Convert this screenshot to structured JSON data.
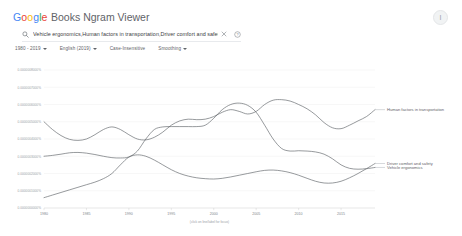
{
  "header": {
    "logo_letters": [
      {
        "ch": "G",
        "color": "#4285F4"
      },
      {
        "ch": "o",
        "color": "#EA4335"
      },
      {
        "ch": "o",
        "color": "#FBBC05"
      },
      {
        "ch": "g",
        "color": "#4285F4"
      },
      {
        "ch": "l",
        "color": "#34A853"
      },
      {
        "ch": "e",
        "color": "#EA4335"
      }
    ],
    "logo_text": "Google",
    "product_name": "Books Ngram Viewer",
    "avatar_glyph": "I",
    "avatar_name": "account-avatar"
  },
  "search": {
    "value": "Vehicle ergonomics,Human factors in transportation,Driver comfort and safety",
    "placeholder": "Search in Google Books Ngram Viewer",
    "search_icon": "search-icon",
    "clear_icon": "close-icon",
    "help_icon": "help-circle-icon",
    "clear_glyph": "×",
    "help_glyph": "?"
  },
  "filters": [
    {
      "label": "1980 - 2019",
      "name": "year-range-dropdown",
      "has_caret": true
    },
    {
      "label": "English (2019)",
      "name": "corpus-dropdown",
      "has_caret": true
    },
    {
      "label": "Case-Insensitive",
      "name": "case-insensitive-toggle",
      "has_caret": false
    },
    {
      "label": "Smoothing",
      "name": "smoothing-dropdown",
      "has_caret": true
    }
  ],
  "chart_data": {
    "type": "line",
    "title": "",
    "xlabel": "",
    "ylabel": "",
    "caption": "(click on line/label for focus)",
    "grid": true,
    "legend_position": "right-inline",
    "xlim": [
      1980,
      2019
    ],
    "ylim": [
      0,
      8e-07
    ],
    "x_ticks": [
      1980,
      1985,
      1990,
      1995,
      2000,
      2005,
      2010,
      2015
    ],
    "x_tick_labels": [
      "1980",
      "1985",
      "1990",
      "1995",
      "2000",
      "2005",
      "2010",
      "2015"
    ],
    "y_ticks": [
      0.0,
      1e-07,
      2e-07,
      3e-07,
      4e-07,
      5e-07,
      6e-07,
      7e-07,
      8e-07
    ],
    "y_tick_labels": [
      "0.0000000000%",
      "0.0000001000%",
      "0.0000002000%",
      "0.0000003000%",
      "0.0000004000%",
      "0.0000005000%",
      "0.0000006000%",
      "0.0000007000%",
      "0.0000008000%"
    ],
    "x": [
      1980,
      1981,
      1982,
      1983,
      1984,
      1985,
      1986,
      1987,
      1988,
      1989,
      1990,
      1991,
      1992,
      1993,
      1994,
      1995,
      1996,
      1997,
      1998,
      1999,
      2000,
      2001,
      2002,
      2003,
      2004,
      2005,
      2006,
      2007,
      2008,
      2009,
      2010,
      2011,
      2012,
      2013,
      2014,
      2015,
      2016,
      2017,
      2018,
      2019
    ],
    "series": [
      {
        "name": "Human factors in transportation",
        "color": "#5f6368",
        "label_x": 2019,
        "values": [
          5e-07,
          4.55e-07,
          4.2e-07,
          3.98e-07,
          3.92e-07,
          4e-07,
          4.25e-07,
          4.55e-07,
          4.7e-07,
          4.55e-07,
          4.25e-07,
          4e-07,
          3.95e-07,
          4.1e-07,
          4.4e-07,
          4.8e-07,
          5.05e-07,
          5.15e-07,
          5.12e-07,
          5.15e-07,
          5.3e-07,
          5.55e-07,
          5.7e-07,
          5.6e-07,
          5.45e-07,
          5.6e-07,
          6e-07,
          6.25e-07,
          6.28e-07,
          6.2e-07,
          6e-07,
          5.75e-07,
          5.4e-07,
          4.95e-07,
          4.65e-07,
          4.6e-07,
          4.8e-07,
          5.05e-07,
          5.3e-07,
          5.7e-07
        ]
      },
      {
        "name": "Vehicle ergonomics",
        "color": "#5f6368",
        "label_x": 2019,
        "values": [
          3e-07,
          3.05e-07,
          3.12e-07,
          3.2e-07,
          3.22e-07,
          3.18e-07,
          3.1e-07,
          3e-07,
          2.92e-07,
          2.9e-07,
          2.96e-07,
          3.3e-07,
          4e-07,
          4.55e-07,
          4.7e-07,
          4.72e-07,
          4.72e-07,
          4.72e-07,
          4.72e-07,
          4.8e-07,
          5.2e-07,
          5.7e-07,
          6e-07,
          6.08e-07,
          5.95e-07,
          5.55e-07,
          4.8e-07,
          4e-07,
          3.45e-07,
          3.3e-07,
          3.32e-07,
          3.3e-07,
          3.25e-07,
          3.12e-07,
          2.85e-07,
          2.5e-07,
          2.3e-07,
          2.25e-07,
          2.28e-07,
          2.35e-07
        ]
      },
      {
        "name": "Driver comfort and safety",
        "color": "#5f6368",
        "label_x": 2019,
        "values": [
          6e-08,
          7.5e-08,
          9e-08,
          1.05e-07,
          1.2e-07,
          1.35e-07,
          1.5e-07,
          1.7e-07,
          2e-07,
          2.5e-07,
          2.95e-07,
          3.08e-07,
          3e-07,
          2.78e-07,
          2.5e-07,
          2.22e-07,
          2e-07,
          1.85e-07,
          1.75e-07,
          1.7e-07,
          1.68e-07,
          1.72e-07,
          1.8e-07,
          1.9e-07,
          2e-07,
          2.1e-07,
          2.18e-07,
          2.2e-07,
          2.15e-07,
          2.05e-07,
          1.9e-07,
          1.72e-07,
          1.55e-07,
          1.45e-07,
          1.45e-07,
          1.55e-07,
          1.75e-07,
          2e-07,
          2.28e-07,
          2.58e-07
        ]
      }
    ]
  }
}
